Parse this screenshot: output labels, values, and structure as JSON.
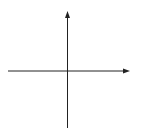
{
  "diagram": {
    "type": "coordinate-grid",
    "axis_labels": {
      "x": "x",
      "y": "y"
    },
    "x_range": [
      -5,
      5
    ],
    "y_range": [
      -5,
      5
    ],
    "grid_step": 1,
    "x_tick_labels": [
      {
        "value": -4,
        "text": "−4"
      },
      {
        "value": -2,
        "text": "−2"
      },
      {
        "value": 0,
        "text": "0"
      },
      {
        "value": 2,
        "text": "2"
      },
      {
        "value": 4,
        "text": "4"
      }
    ],
    "y_tick_labels": [
      {
        "value": 4,
        "text": "4"
      },
      {
        "value": 2,
        "text": "2"
      },
      {
        "value": -2,
        "text": "−2"
      },
      {
        "value": -4,
        "text": "−4"
      }
    ],
    "colors": {
      "grid": "#d4d4d4",
      "axis": "#222222",
      "background": "#ffffff"
    }
  }
}
